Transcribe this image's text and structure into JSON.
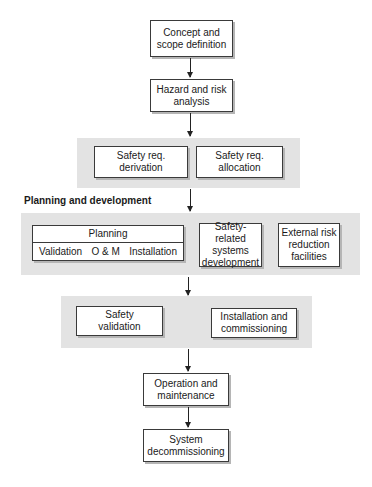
{
  "diagram": {
    "nodes": {
      "concept": {
        "line1": "Concept and",
        "line2": "scope definition"
      },
      "hazard": {
        "line1": "Hazard and risk",
        "line2": "analysis"
      },
      "req_derivation": {
        "line1": "Safety req.",
        "line2": "derivation"
      },
      "req_allocation": {
        "line1": "Safety req.",
        "line2": "allocation"
      },
      "planning": {
        "title": "Planning",
        "subitems": [
          "Validation",
          "O & M",
          "Installation"
        ]
      },
      "srs_development": {
        "line1": "Safety-related",
        "line2": "systems",
        "line3": "development"
      },
      "external_risk": {
        "line1": "External risk",
        "line2": "reduction",
        "line3": "facilities"
      },
      "safety_validation": {
        "line1": "Safety",
        "line2": "validation"
      },
      "installation": {
        "line1": "Installation and",
        "line2": "commissioning"
      },
      "operation": {
        "line1": "Operation and",
        "line2": "maintenance"
      },
      "decommissioning": {
        "line1": "System",
        "line2": "decommissioning"
      }
    },
    "section_label": "Planning and development",
    "colors": {
      "band": "#e3e3e3",
      "box_border": "#3a3a3a",
      "shadow": "#b5b5b5",
      "arrow": "#222222"
    }
  }
}
